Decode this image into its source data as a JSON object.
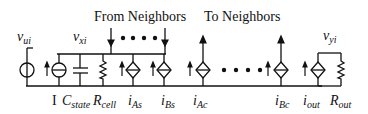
{
  "headers": {
    "from_neighbors": "From Neighbors",
    "to_neighbors": "To Neighbors"
  },
  "nodes": {
    "v_ui": {
      "base": "v",
      "sub": "ui"
    },
    "v_xi": {
      "base": "v",
      "sub": "xi"
    },
    "v_yi": {
      "base": "v",
      "sub": "yi"
    }
  },
  "components": {
    "I": {
      "base": "I",
      "sub": ""
    },
    "C_state": {
      "base": "C",
      "sub": "state"
    },
    "R_cell": {
      "base": "R",
      "sub": "cell"
    },
    "i_As": {
      "base": "i",
      "sub": "As"
    },
    "i_Bs": {
      "base": "i",
      "sub": "Bs"
    },
    "i_Ac": {
      "base": "i",
      "sub": "Ac"
    },
    "i_Bc": {
      "base": "i",
      "sub": "Bc"
    },
    "i_out": {
      "base": "i",
      "sub": "out"
    },
    "R_out": {
      "base": "R",
      "sub": "out"
    }
  },
  "ellipsis": "• • • •",
  "colors": {
    "line": "#111111",
    "background": "#ffffff"
  }
}
